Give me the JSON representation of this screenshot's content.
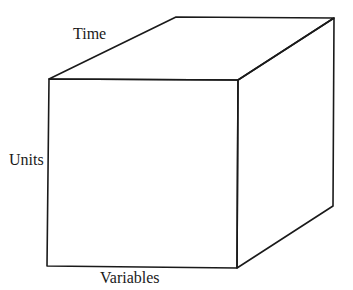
{
  "diagram": {
    "type": "data-cube",
    "labels": {
      "time": "Time",
      "units": "Units",
      "variables": "Variables"
    },
    "colors": {
      "stroke": "#1a1a1a",
      "background": "#ffffff",
      "text": "#1a1a1a"
    }
  }
}
